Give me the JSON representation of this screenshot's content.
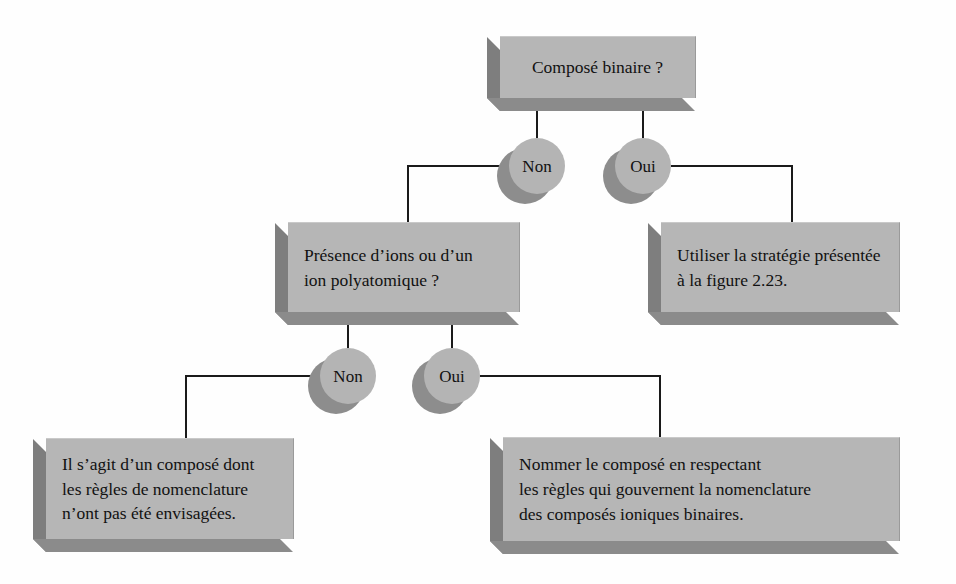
{
  "diagram": {
    "colors": {
      "box_face": "#b6b6b6",
      "box_left_bevel": "#7e7e7e",
      "box_bottom_bevel": "#8b8b8b",
      "circle_face": "#b4b4b4",
      "circle_shadow": "#8d8d8d",
      "line": "#1a1a1a",
      "background": "#fefefe",
      "text": "#111111"
    },
    "nodes": {
      "root": {
        "label": "Composé binaire ?",
        "align": "center"
      },
      "ions_question": {
        "label": "Présence d’ions ou d’un\nion polyatomique ?",
        "align": "left"
      },
      "strategy_223": {
        "label": "Utiliser la stratégie présentée\nà la figure 2.23.",
        "align": "left"
      },
      "not_covered": {
        "label": "Il s’agit d’un composé dont\nles règles de nomenclature\nn’ont pas été envisagées.",
        "align": "left"
      },
      "binary_ionic": {
        "label": "Nommer le composé en respectant\nles règles qui gouvernent la nomenclature\ndes composés ioniques binaires.",
        "align": "left"
      }
    },
    "decisions": {
      "root_no": "Non",
      "root_yes": "Oui",
      "ions_no": "Non",
      "ions_yes": "Oui"
    }
  }
}
